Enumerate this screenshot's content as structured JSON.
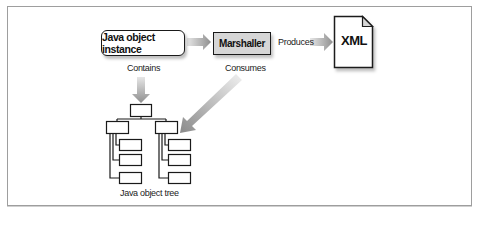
{
  "diagram": {
    "nodes": {
      "instance": "Java object instance",
      "marshaller": "Marshaller",
      "xml": "XML",
      "tree": "Java object tree"
    },
    "edges": {
      "contains": "Contains",
      "consumes": "Consumes",
      "produces": "Produces"
    },
    "colors": {
      "border": "#1a1a1a",
      "marshaller_fill": "#d6d6d6",
      "arrow_gray": "#9a9a9a",
      "frame": "#9e9e9e"
    }
  }
}
